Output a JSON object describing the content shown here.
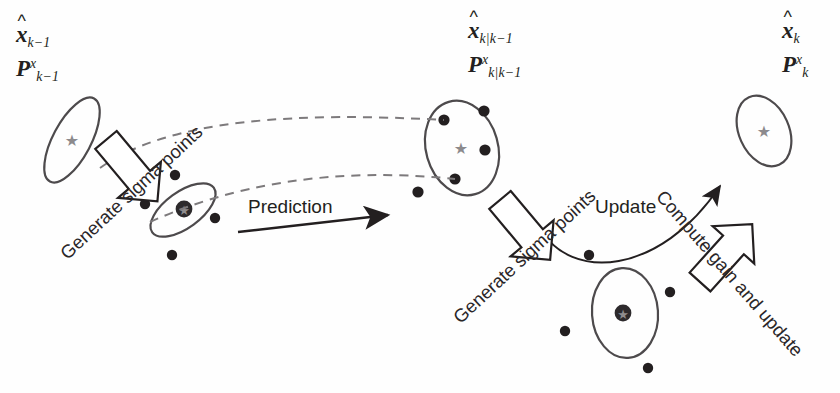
{
  "diagram": {
    "background_color": "#ffffff",
    "ink_color": "#231f20",
    "ellipse_color": "#4d4a4c",
    "star_color": "#8c8a8d",
    "dot_color": "#231f20",
    "dashed_color": "#7d7a7c"
  },
  "labels": {
    "state_prev": {
      "state_base": "x",
      "state_hat": "^",
      "state_sub": "k−1",
      "cov_base": "P",
      "cov_sup": "x",
      "cov_sub": "k−1"
    },
    "state_pred": {
      "state_base": "x",
      "state_hat": "^",
      "state_sub": "k|k−1",
      "cov_base": "P",
      "cov_sup": "x",
      "cov_sub": "k|k−1"
    },
    "state_post": {
      "state_base": "x",
      "state_hat": "^",
      "state_sub": "k",
      "cov_base": "P",
      "cov_sup": "x",
      "cov_sub": "k"
    }
  },
  "annotations": {
    "generate_sigma_points_1": "Generate sigma points",
    "generate_sigma_points_2": "Generate sigma points",
    "prediction": "Prediction",
    "update": "Update",
    "compute_gain_and_update": "Compute gain and update"
  },
  "elements": {
    "ellipses": [
      {
        "name": "covariance-ellipse-prev",
        "cx": 72,
        "cy": 140,
        "rx": 47,
        "ry": 19,
        "rot": -62,
        "star": true
      },
      {
        "name": "covariance-ellipse-pred",
        "cx": 462,
        "cy": 148,
        "rx": 36,
        "ry": 48,
        "rot": -16,
        "star": true
      },
      {
        "name": "covariance-ellipse-post",
        "cx": 764,
        "cy": 131,
        "rx": 25,
        "ry": 37,
        "rot": -24,
        "star": true
      },
      {
        "name": "sigma-cluster-ellipse-1",
        "cx": 183,
        "cy": 210,
        "rx": 38,
        "ry": 18,
        "rot": -36,
        "star": false
      },
      {
        "name": "sigma-cluster-ellipse-2",
        "cx": 625,
        "cy": 313,
        "rx": 33,
        "ry": 45,
        "rot": -4,
        "star": false
      }
    ],
    "sigma_points_cluster_1": [
      {
        "x": 175,
        "y": 175
      },
      {
        "x": 145,
        "y": 204
      },
      {
        "x": 215,
        "y": 218
      },
      {
        "x": 172,
        "y": 255
      }
    ],
    "sigma_points_cluster_2": [
      {
        "x": 589,
        "y": 255
      },
      {
        "x": 670,
        "y": 292
      },
      {
        "x": 565,
        "y": 331
      },
      {
        "x": 648,
        "y": 368
      }
    ],
    "sigma_points_pred_ellipse": [
      {
        "x": 444,
        "y": 120
      },
      {
        "x": 484,
        "y": 111
      },
      {
        "x": 485,
        "y": 150
      },
      {
        "x": 455,
        "y": 179
      },
      {
        "x": 418,
        "y": 192
      }
    ],
    "cluster_centers": [
      {
        "name": "cluster-center-1",
        "x": 184,
        "y": 209
      },
      {
        "name": "cluster-center-2",
        "x": 623,
        "y": 313
      }
    ]
  }
}
